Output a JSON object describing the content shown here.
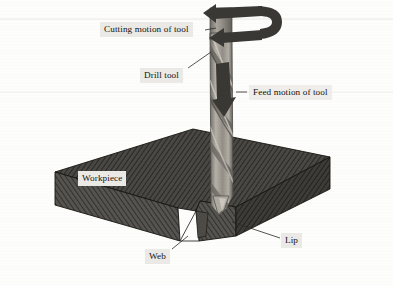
{
  "figure": {
    "background_color": "#fdfdfc"
  },
  "callouts": [
    {
      "id": "cutting",
      "label": "Cutting motion of tool",
      "icon": "text-callout"
    },
    {
      "id": "drill",
      "label": "Drill tool",
      "icon": "text-callout"
    },
    {
      "id": "feed",
      "label": "Feed motion of tool",
      "icon": "text-callout"
    },
    {
      "id": "workpiece",
      "label": "Workpiece",
      "icon": "text-callout"
    },
    {
      "id": "web",
      "label": "Web",
      "icon": "text-callout"
    },
    {
      "id": "lip",
      "label": "Lip",
      "icon": "text-callout"
    }
  ],
  "parts": {
    "rotation_arrow": "curved-rotation-arrow",
    "feed_arrow": "down-feed-arrow",
    "drill": "twist-drill-tool",
    "block": "hatched-workpiece-block",
    "notch": "drilled-notch"
  },
  "colors": {
    "block_fill": "#4a4844",
    "block_front": "#565450",
    "block_right": "#3e3c38",
    "hatch": "#2a2825",
    "tool_light": "#b9b5ad",
    "tool_mid": "#8e8a82",
    "tool_dark": "#6a6760",
    "arrow": "#3a3834",
    "label_bg": "#ebeae7",
    "text": "#15130f"
  }
}
